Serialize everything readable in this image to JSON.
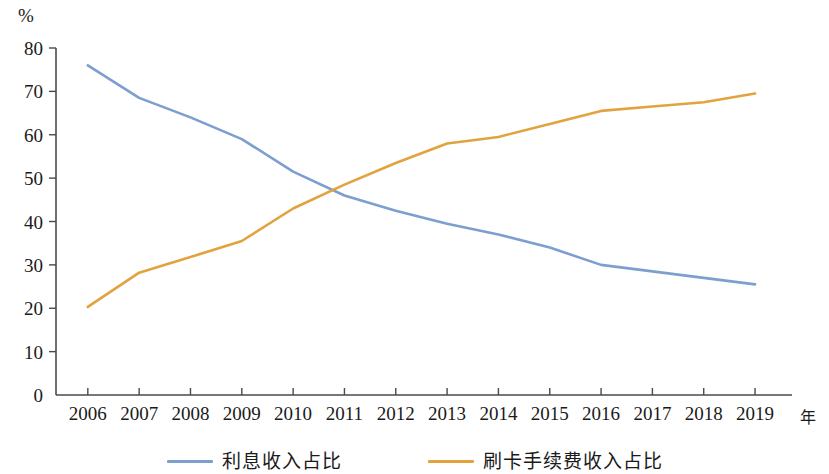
{
  "axis": {
    "unit_label": "%",
    "x_axis_title": "年",
    "y_ticks": [
      "0",
      "10",
      "20",
      "30",
      "40",
      "50",
      "60",
      "70",
      "80"
    ],
    "x_ticks": [
      "2006",
      "2007",
      "2008",
      "2009",
      "2010",
      "2011",
      "2012",
      "2013",
      "2014",
      "2015",
      "2016",
      "2017",
      "2018",
      "2019"
    ]
  },
  "legend": {
    "items": [
      {
        "label": "利息收入占比",
        "color": "#7C9FD0"
      },
      {
        "label": "刷卡手续费收入占比",
        "color": "#E2A33F"
      }
    ]
  },
  "chart_data": {
    "type": "line",
    "title": "",
    "subtitle": "",
    "xlabel": "年",
    "ylabel": "%",
    "ylim": [
      0,
      80
    ],
    "ytick_step": 10,
    "grid": false,
    "legend_position": "bottom",
    "categories": [
      "2006",
      "2007",
      "2008",
      "2009",
      "2010",
      "2011",
      "2012",
      "2013",
      "2014",
      "2015",
      "2016",
      "2017",
      "2018",
      "2019"
    ],
    "series": [
      {
        "name": "利息收入占比",
        "color": "#7C9FD0",
        "values": [
          76.0,
          68.5,
          64.0,
          59.0,
          51.5,
          46.0,
          42.5,
          39.5,
          37.0,
          34.0,
          30.0,
          28.5,
          27.0,
          25.5
        ]
      },
      {
        "name": "刷卡手续费收入占比",
        "color": "#E2A33F",
        "values": [
          20.3,
          28.2,
          31.8,
          35.5,
          43.0,
          48.5,
          53.5,
          58.0,
          59.5,
          62.5,
          65.5,
          66.5,
          67.5,
          69.5
        ]
      }
    ]
  }
}
